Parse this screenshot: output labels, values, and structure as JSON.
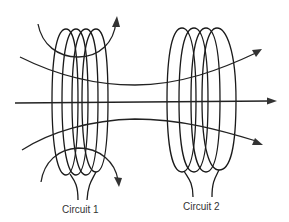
{
  "figure": {
    "colors": {
      "line": "#1a1a1a",
      "label": "#333333",
      "background": "#ffffff"
    }
  },
  "circuits": [
    {
      "id": "circuit-1",
      "label": "Circuit 1",
      "turns": 4
    },
    {
      "id": "circuit-2",
      "label": "Circuit 2",
      "turns": 4
    }
  ],
  "field_lines": [
    {
      "name": "upper-field-line",
      "direction": "right"
    },
    {
      "name": "axial-field-line",
      "direction": "right"
    },
    {
      "name": "lower-field-line",
      "direction": "right"
    },
    {
      "name": "top-loop-field-line",
      "direction": "clockwise"
    },
    {
      "name": "bottom-loop-field-line",
      "direction": "clockwise"
    }
  ]
}
